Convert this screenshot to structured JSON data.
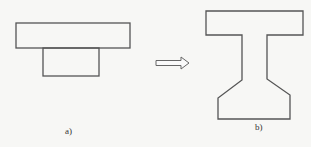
{
  "figures": {
    "a": {
      "label": "a)",
      "description": "Inverted T-shaped cross-section: wide top rectangle with narrower rectangle beneath"
    },
    "b": {
      "label": "b)",
      "description": "I-beam style cross-section: top flange, narrow web, tapered bottom flange"
    }
  },
  "arrow": {
    "direction": "right",
    "style": "hollow"
  },
  "colors": {
    "stroke": "#555555",
    "background": "#f7f7f5"
  }
}
